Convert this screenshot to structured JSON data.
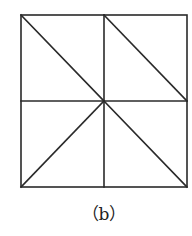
{
  "figure": {
    "caption": "（b）",
    "stroke_color": "#2a2a2a",
    "square": {
      "x1": 21,
      "y1": 15,
      "x2": 187,
      "y2": 187
    },
    "lines": [
      {
        "name": "vertical-midline",
        "x1": 104,
        "y1": 15,
        "x2": 104,
        "y2": 187
      },
      {
        "name": "horizontal-midline",
        "x1": 21,
        "y1": 101,
        "x2": 187,
        "y2": 101
      },
      {
        "name": "diagonal-topleft-to-center",
        "x1": 21,
        "y1": 15,
        "x2": 104,
        "y2": 101
      },
      {
        "name": "diagonal-topmid-to-rightmid",
        "x1": 104,
        "y1": 15,
        "x2": 187,
        "y2": 101
      },
      {
        "name": "diagonal-center-to-bottomleft",
        "x1": 104,
        "y1": 101,
        "x2": 21,
        "y2": 187
      },
      {
        "name": "diagonal-center-to-bottomright",
        "x1": 104,
        "y1": 101,
        "x2": 187,
        "y2": 187
      }
    ]
  }
}
